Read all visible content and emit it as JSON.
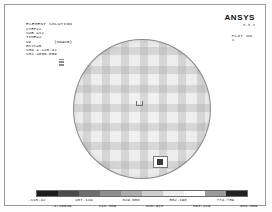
{
  "window": {
    "title": "ANSYS Element Solution Plot"
  },
  "header": {
    "title": "ELEMENT SOLUTION",
    "lines": [
      "STEP=2",
      "SUB =11",
      "TIME=2",
      "UZ         (NOAVG)",
      "RSYS=0",
      "SMN =-115.42",
      "SMX =886.009"
    ]
  },
  "logo": {
    "brand": "ANSYS",
    "version": "5.5.3",
    "plot_label": "PLOT NO.",
    "plot_number": "1"
  },
  "plot": {
    "shape": "circular-disc-mesh",
    "min_marker_label": "MN",
    "max_marker_label": "MX"
  },
  "chart_data": {
    "type": "heatmap",
    "title": "ELEMENT SOLUTION",
    "xlabel": "",
    "ylabel": "",
    "legend_position": "bottom",
    "grid": false,
    "contour_min": -115.42,
    "contour_max": 886.009,
    "tick_values": [
      "-115.42",
      "-4.15049",
      "107.119",
      "218.389",
      "329.658",
      "440.928",
      "552.198",
      "663.429",
      "774.739",
      "886.009"
    ],
    "band_colors": [
      "#1c1c1c",
      "#4a4a4a",
      "#6e6e6e",
      "#8e8e8e",
      "#ababab",
      "#cfcfcf",
      "#ededed",
      "#fdfdfd",
      "#9a9a9a",
      "#222222"
    ],
    "series": [
      {
        "name": "UZ",
        "values": [
          -115.42,
          886.009
        ]
      }
    ]
  }
}
